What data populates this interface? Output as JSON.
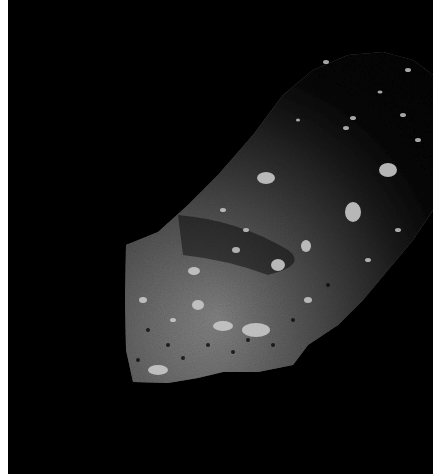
{
  "image": {
    "subject": "asteroid surface",
    "description": "Rubble-pile asteroid limb illuminated against black space",
    "colors": {
      "background": "#000000",
      "margin": "#ffffff",
      "regolith_light": "#b8b8b8",
      "regolith_mid": "#6e6e6e",
      "regolith_dark": "#2a2a2a"
    }
  }
}
